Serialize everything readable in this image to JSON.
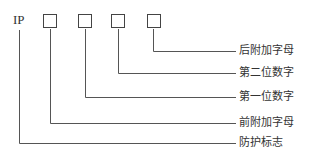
{
  "diagram": {
    "prefix": "IP",
    "boxes": [
      "box-1",
      "box-2",
      "box-3",
      "box-4"
    ],
    "labels": [
      {
        "id": "suffix-letter",
        "text": "后附加字母"
      },
      {
        "id": "second-digit",
        "text": "第二位数字"
      },
      {
        "id": "first-digit",
        "text": "第一位数字"
      },
      {
        "id": "prefix-letter",
        "text": "前附加字母"
      },
      {
        "id": "protection-mark",
        "text": "防护标志"
      }
    ]
  }
}
